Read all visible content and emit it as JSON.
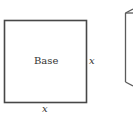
{
  "figure": {
    "square": {
      "center_label": "Base",
      "right_side_label": "x",
      "bottom_side_label": "x",
      "stroke_color": "#474747"
    },
    "partial_box": {
      "description": "partially visible 3D box at right edge",
      "stroke_color": "#5a5a5a"
    }
  }
}
